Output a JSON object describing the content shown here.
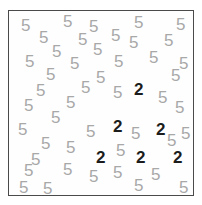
{
  "task": {
    "type": "visual-search-array",
    "target_symbol": "2",
    "distractor_symbol": "5",
    "target_count": 6,
    "distractor_count": 45,
    "total_items": 51
  },
  "panel": {
    "border_color": "#4a4a4a",
    "background_color": "#fefefe",
    "left": 8,
    "top": 10,
    "width": 186,
    "height": 186
  },
  "style": {
    "distractor_color": "#a8a8a8",
    "target_color": "#1c1c1c",
    "font_size": 17
  },
  "items": [
    {
      "symbol": "5",
      "role": "distractor",
      "x": 20,
      "y": 16
    },
    {
      "symbol": "5",
      "role": "distractor",
      "x": 62,
      "y": 12
    },
    {
      "symbol": "5",
      "role": "distractor",
      "x": 88,
      "y": 17
    },
    {
      "symbol": "5",
      "role": "distractor",
      "x": 133,
      "y": 13
    },
    {
      "symbol": "5",
      "role": "distractor",
      "x": 175,
      "y": 15
    },
    {
      "symbol": "5",
      "role": "distractor",
      "x": 38,
      "y": 28
    },
    {
      "symbol": "5",
      "role": "distractor",
      "x": 77,
      "y": 30
    },
    {
      "symbol": "5",
      "role": "distractor",
      "x": 110,
      "y": 26
    },
    {
      "symbol": "5",
      "role": "distractor",
      "x": 128,
      "y": 33
    },
    {
      "symbol": "5",
      "role": "distractor",
      "x": 163,
      "y": 31
    },
    {
      "symbol": "5",
      "role": "distractor",
      "x": 51,
      "y": 42
    },
    {
      "symbol": "5",
      "role": "distractor",
      "x": 92,
      "y": 40
    },
    {
      "symbol": "5",
      "role": "distractor",
      "x": 24,
      "y": 52
    },
    {
      "symbol": "5",
      "role": "distractor",
      "x": 69,
      "y": 54
    },
    {
      "symbol": "5",
      "role": "distractor",
      "x": 113,
      "y": 52
    },
    {
      "symbol": "5",
      "role": "distractor",
      "x": 148,
      "y": 48
    },
    {
      "symbol": "5",
      "role": "distractor",
      "x": 178,
      "y": 54
    },
    {
      "symbol": "5",
      "role": "distractor",
      "x": 45,
      "y": 65
    },
    {
      "symbol": "5",
      "role": "distractor",
      "x": 95,
      "y": 68
    },
    {
      "symbol": "5",
      "role": "distractor",
      "x": 170,
      "y": 66
    },
    {
      "symbol": "5",
      "role": "distractor",
      "x": 35,
      "y": 81
    },
    {
      "symbol": "5",
      "role": "distractor",
      "x": 80,
      "y": 78
    },
    {
      "symbol": "5",
      "role": "distractor",
      "x": 112,
      "y": 83
    },
    {
      "symbol": "2",
      "role": "target",
      "x": 133,
      "y": 80
    },
    {
      "symbol": "5",
      "role": "distractor",
      "x": 157,
      "y": 88
    },
    {
      "symbol": "5",
      "role": "distractor",
      "x": 23,
      "y": 96
    },
    {
      "symbol": "5",
      "role": "distractor",
      "x": 65,
      "y": 93
    },
    {
      "symbol": "5",
      "role": "distractor",
      "x": 174,
      "y": 98
    },
    {
      "symbol": "5",
      "role": "distractor",
      "x": 50,
      "y": 108
    },
    {
      "symbol": "2",
      "role": "target",
      "x": 112,
      "y": 117
    },
    {
      "symbol": "5",
      "role": "distractor",
      "x": 17,
      "y": 120
    },
    {
      "symbol": "5",
      "role": "distractor",
      "x": 85,
      "y": 122
    },
    {
      "symbol": "5",
      "role": "distractor",
      "x": 130,
      "y": 124
    },
    {
      "symbol": "2",
      "role": "target",
      "x": 155,
      "y": 120
    },
    {
      "symbol": "5",
      "role": "distractor",
      "x": 180,
      "y": 124
    },
    {
      "symbol": "5",
      "role": "distractor",
      "x": 40,
      "y": 134
    },
    {
      "symbol": "5",
      "role": "distractor",
      "x": 65,
      "y": 138
    },
    {
      "symbol": "5",
      "role": "distractor",
      "x": 166,
      "y": 131
    },
    {
      "symbol": "2",
      "role": "target",
      "x": 95,
      "y": 148
    },
    {
      "symbol": "2",
      "role": "target",
      "x": 135,
      "y": 148
    },
    {
      "symbol": "2",
      "role": "target",
      "x": 172,
      "y": 148
    },
    {
      "symbol": "5",
      "role": "distractor",
      "x": 30,
      "y": 150
    },
    {
      "symbol": "5",
      "role": "distractor",
      "x": 115,
      "y": 141
    },
    {
      "symbol": "5",
      "role": "distractor",
      "x": 23,
      "y": 161
    },
    {
      "symbol": "5",
      "role": "distractor",
      "x": 62,
      "y": 160
    },
    {
      "symbol": "5",
      "role": "distractor",
      "x": 88,
      "y": 167
    },
    {
      "symbol": "5",
      "role": "distractor",
      "x": 112,
      "y": 163
    },
    {
      "symbol": "5",
      "role": "distractor",
      "x": 150,
      "y": 165
    },
    {
      "symbol": "5",
      "role": "distractor",
      "x": 18,
      "y": 178
    },
    {
      "symbol": "5",
      "role": "distractor",
      "x": 42,
      "y": 179
    },
    {
      "symbol": "5",
      "role": "distractor",
      "x": 133,
      "y": 176
    },
    {
      "symbol": "5",
      "role": "distractor",
      "x": 178,
      "y": 178
    }
  ]
}
